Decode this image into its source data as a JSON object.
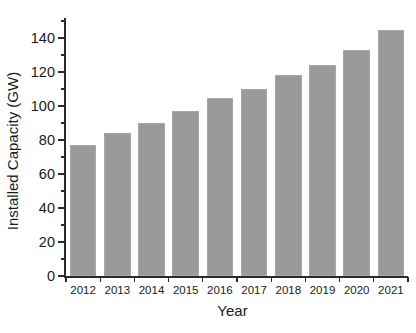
{
  "chart_data": {
    "type": "bar",
    "title": "",
    "xlabel": "Year",
    "ylabel": "Installed Capacity (GW)",
    "categories": [
      "2012",
      "2013",
      "2014",
      "2015",
      "2016",
      "2017",
      "2018",
      "2019",
      "2020",
      "2021"
    ],
    "values": [
      77,
      84,
      90,
      97,
      105,
      110,
      118,
      124,
      133,
      145
    ],
    "ylim": [
      0,
      150
    ],
    "yticks": [
      0,
      20,
      40,
      60,
      80,
      100,
      120,
      140
    ],
    "ytick_labels": [
      "0",
      "20",
      "40",
      "60",
      "80",
      "100",
      "120",
      "140"
    ],
    "y_minor_ticks": [
      10,
      30,
      50,
      70,
      90,
      110,
      130,
      150
    ],
    "grid": false,
    "legend": null,
    "legend_position": "none",
    "bar_color": "#9a9a9a",
    "bar_edge_color": "#a8a8a8",
    "axis_color": "#2b2b2b",
    "background_color": "#ffffff",
    "series": [
      {
        "name": "Installed Capacity",
        "values": [
          77,
          84,
          90,
          97,
          105,
          110,
          118,
          124,
          133,
          145
        ]
      }
    ]
  }
}
